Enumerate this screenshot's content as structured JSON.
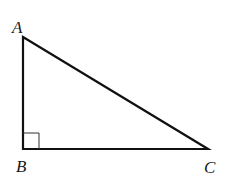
{
  "diagram": {
    "type": "right-triangle",
    "stroke_color": "#111111",
    "background": "#ffffff",
    "vertices": [
      {
        "label": "A",
        "x": 23,
        "y": 37
      },
      {
        "label": "B",
        "x": 23,
        "y": 149
      },
      {
        "label": "C",
        "x": 208,
        "y": 149
      }
    ],
    "right_angle_at": "B",
    "labels": {
      "a": "A",
      "b": "B",
      "c": "C"
    }
  }
}
